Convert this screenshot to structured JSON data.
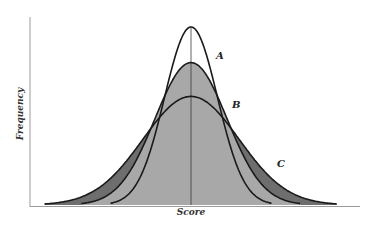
{
  "chart_data": {
    "type": "line",
    "title": "",
    "xlabel": "Score",
    "ylabel": "Frequency",
    "grid": false,
    "legend": "inline labels",
    "series": [
      {
        "name": "A",
        "mean": 0,
        "relative_sd": 0.55,
        "relative_peak": 1.0,
        "fill": "#ffffff"
      },
      {
        "name": "B",
        "mean": 0,
        "relative_sd": 0.75,
        "relative_peak": 0.8,
        "fill": "#a8a8a8"
      },
      {
        "name": "C",
        "mean": 0,
        "relative_sd": 1.0,
        "relative_peak": 0.61,
        "fill": "#6e6e6e"
      }
    ],
    "annotations": [
      "A",
      "B",
      "C"
    ],
    "center_line": true
  },
  "labels": {
    "a": "A",
    "b": "B",
    "c": "C",
    "x_axis": "Score",
    "y_axis": "Frequency"
  },
  "colors": {
    "fill_a": "#ffffff",
    "fill_b": "#a8a8a8",
    "fill_c": "#6e6e6e",
    "stroke": "#1a1a1a",
    "axis": "#9a9a9a"
  }
}
